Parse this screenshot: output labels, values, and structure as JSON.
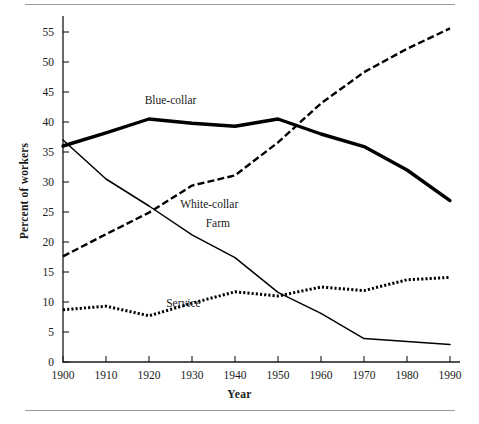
{
  "chart_data": {
    "type": "line",
    "title": "",
    "xlabel": "Year",
    "ylabel": "Percent of workers",
    "x": [
      1900,
      1910,
      1920,
      1930,
      1940,
      1950,
      1960,
      1970,
      1980,
      1990
    ],
    "xlim": [
      1900,
      1990
    ],
    "ylim": [
      0,
      57
    ],
    "xticks": [
      1900,
      1910,
      1920,
      1930,
      1940,
      1950,
      1960,
      1970,
      1980,
      1990
    ],
    "yticks": [
      0,
      5,
      10,
      15,
      20,
      25,
      30,
      35,
      40,
      45,
      50,
      55
    ],
    "grid": false,
    "legend_position": "inline-labels",
    "series": [
      {
        "name": "Blue-collar",
        "values": [
          36.0,
          38.2,
          40.5,
          39.8,
          39.3,
          40.5,
          38.0,
          35.9,
          32.0,
          26.9
        ],
        "style": "solid-thick",
        "label_x": 1925,
        "label_y": 43.0
      },
      {
        "name": "White-collar",
        "values": [
          17.6,
          21.3,
          24.9,
          29.4,
          31.1,
          36.6,
          43.1,
          48.3,
          52.2,
          55.6
        ],
        "style": "dashed",
        "label_x": 1934,
        "label_y": 25.6
      },
      {
        "name": "Farm",
        "values": [
          37.0,
          30.5,
          26.0,
          21.2,
          17.4,
          11.6,
          8.1,
          3.9,
          3.4,
          2.9
        ],
        "style": "solid-thin",
        "label_x": 1936,
        "label_y": 22.5
      },
      {
        "name": "Service",
        "values": [
          8.7,
          9.3,
          7.7,
          9.8,
          11.7,
          11.0,
          12.5,
          11.9,
          13.7,
          14.1
        ],
        "style": "dotted",
        "label_x": 1928,
        "label_y": 9.2
      }
    ]
  },
  "axes": {
    "x_tick_labels": [
      "1900",
      "1910",
      "1920",
      "1930",
      "1940",
      "1950",
      "1960",
      "1970",
      "1980",
      "1990"
    ],
    "y_tick_labels": [
      "0",
      "5",
      "10",
      "15",
      "20",
      "25",
      "30",
      "35",
      "40",
      "45",
      "50",
      "55"
    ]
  },
  "colors": {
    "ink": "#1a1a1a",
    "line": "#000000",
    "rule": "#9a9a9a",
    "background": "#ffffff"
  }
}
